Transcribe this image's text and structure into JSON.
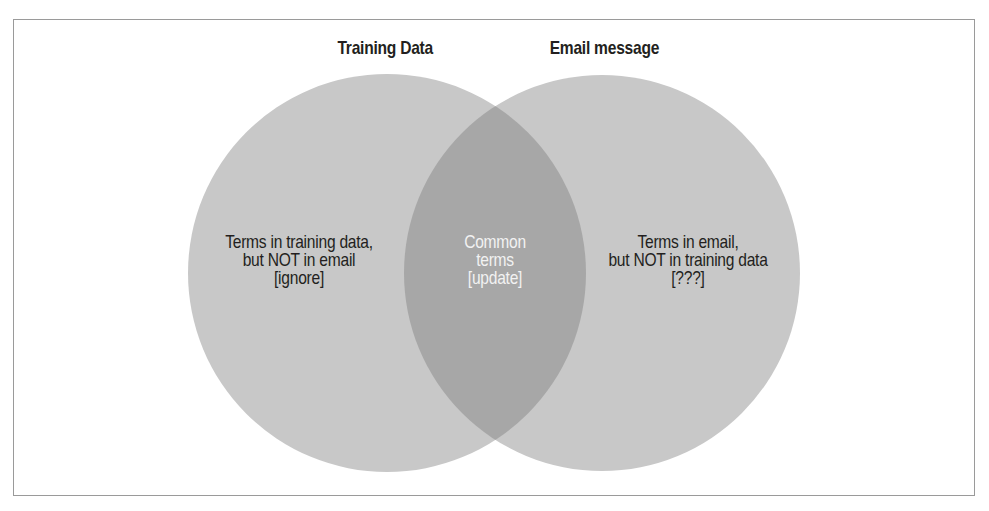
{
  "diagram": {
    "type": "venn",
    "colors": {
      "frame": "#9a9a9a",
      "circle_fill": "#c8c8c8",
      "overlap_fill": "#a7a7a7",
      "label_text": "#231f20",
      "overlap_text": "#f2f2f2"
    },
    "sets": [
      {
        "title": "Training Data",
        "region_lines": [
          "Terms in training data,",
          "but NOT in email",
          "[ignore]"
        ]
      },
      {
        "title": "Email message",
        "region_lines": [
          "Terms in email,",
          "but NOT in training data",
          "[???]"
        ]
      }
    ],
    "intersection": {
      "region_lines": [
        "Common",
        "terms",
        "[update]"
      ]
    }
  }
}
